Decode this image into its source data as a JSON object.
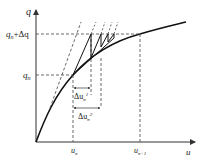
{
  "diagram": {
    "type": "load-displacement curve with incremental iterations",
    "axes": {
      "y_label": "q",
      "x_label": "u"
    },
    "labels": {
      "q_upper": "q",
      "q_upper_sub": "n",
      "q_upper_suffix": "+Δq",
      "q_lower": "q",
      "q_lower_sub": "n",
      "u_left": "u",
      "u_left_sub": "n",
      "u_right": "u",
      "u_right_sub": "n+1",
      "du1": "Δu",
      "du1_sub": "n",
      "du1_sup": "1",
      "du2": "Δu",
      "du2_sub": "n",
      "du2_sup": "2"
    },
    "colors": {
      "curve": "#111111",
      "dashed": "#444444",
      "axis": "#333333"
    }
  }
}
